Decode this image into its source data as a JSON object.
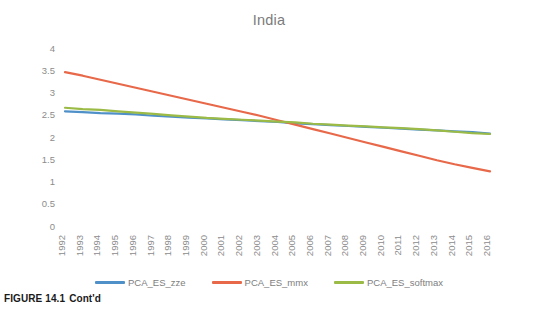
{
  "figure": {
    "caption_prefix": "FIGURE 14.1",
    "caption_text": "Cont'd"
  },
  "chart_data": {
    "type": "line",
    "title": "India",
    "xlabel": "",
    "ylabel": "",
    "ylim": [
      0,
      4
    ],
    "ytick_values": [
      0,
      0.5,
      1,
      1.5,
      2,
      2.5,
      3,
      3.5,
      4
    ],
    "ytick_labels": [
      "0",
      "0.5",
      "1",
      "1.5",
      "2",
      "2.5",
      "3",
      "3.5",
      "4"
    ],
    "grid": false,
    "legend_position": "bottom",
    "x_tick_rotation": 90,
    "categories": [
      "1992",
      "1993",
      "1994",
      "1995",
      "1996",
      "1997",
      "1998",
      "1999",
      "2000",
      "2001",
      "2002",
      "2003",
      "2004",
      "2005",
      "2006",
      "2007",
      "2008",
      "2009",
      "2010",
      "2011",
      "2012",
      "2013",
      "2014",
      "2015",
      "2016"
    ],
    "series": [
      {
        "name": "PCA_ES_zze",
        "color": "#4F90C8",
        "values": [
          2.6,
          2.58,
          2.56,
          2.55,
          2.53,
          2.5,
          2.48,
          2.46,
          2.44,
          2.42,
          2.4,
          2.38,
          2.36,
          2.33,
          2.31,
          2.29,
          2.27,
          2.25,
          2.23,
          2.21,
          2.19,
          2.17,
          2.15,
          2.13,
          2.1
        ]
      },
      {
        "name": "PCA_ES_mmx",
        "color": "#E8684A",
        "values": [
          3.48,
          3.4,
          3.31,
          3.22,
          3.13,
          3.04,
          2.95,
          2.86,
          2.77,
          2.68,
          2.59,
          2.5,
          2.4,
          2.3,
          2.2,
          2.1,
          2.0,
          1.9,
          1.8,
          1.7,
          1.6,
          1.5,
          1.41,
          1.33,
          1.25
        ]
      },
      {
        "name": "PCA_ES_softmax",
        "color": "#9BBB46",
        "values": [
          2.68,
          2.65,
          2.63,
          2.6,
          2.57,
          2.54,
          2.51,
          2.48,
          2.45,
          2.43,
          2.41,
          2.39,
          2.37,
          2.35,
          2.32,
          2.3,
          2.28,
          2.26,
          2.24,
          2.22,
          2.2,
          2.17,
          2.14,
          2.11,
          2.09
        ]
      }
    ]
  },
  "legend": {
    "items": [
      {
        "label": "PCA_ES_zze",
        "color": "#4F90C8"
      },
      {
        "label": "PCA_ES_mmx",
        "color": "#E8684A"
      },
      {
        "label": "PCA_ES_softmax",
        "color": "#9BBB46"
      }
    ]
  }
}
